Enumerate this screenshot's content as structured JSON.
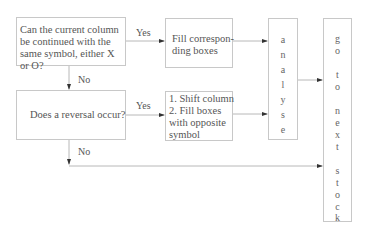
{
  "flowchart": {
    "question1": {
      "text": "Can the current column be continued with the same symbol, either X or O?"
    },
    "action1": {
      "text": "Fill correspon-ding boxes",
      "line1": "Fill correspon-",
      "line2": "ding boxes"
    },
    "question2": {
      "text": "Does a reversal occur?"
    },
    "action2": {
      "line1": "1. Shift column",
      "line2": "2. Fill boxes",
      "line3": "with opposite",
      "line4": "symbol"
    },
    "analyse": {
      "letters": [
        "a",
        "n",
        "a",
        "l",
        "y",
        "s",
        "e"
      ]
    },
    "next_stock": {
      "letters": [
        "g",
        "o",
        "",
        "t",
        "o",
        "",
        "n",
        "e",
        "x",
        "t",
        "",
        "s",
        "t",
        "o",
        "c",
        "k"
      ]
    },
    "labels": {
      "yes1": "Yes",
      "no1": "No",
      "yes2": "Yes",
      "no2": "No"
    },
    "colors": {
      "border": "#c8c8c8",
      "line": "#b8b8b8",
      "arrow": "#333333",
      "text": "#555555"
    }
  }
}
